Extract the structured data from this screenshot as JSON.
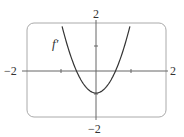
{
  "chart_data": {
    "type": "line",
    "title": "",
    "xlabel": "",
    "ylabel": "",
    "xlim": [
      -2,
      2
    ],
    "ylim": [
      -2,
      2
    ],
    "x_tick_labels": [
      "-2",
      "2"
    ],
    "y_tick_labels": [
      "2",
      "-2"
    ],
    "ticks": {
      "x": [
        -1,
        1
      ],
      "y": [
        1
      ]
    },
    "grid": false,
    "series": [
      {
        "name": "f′",
        "label": "f′",
        "description": "upward parabola, vertex near (0, -0.9), roots near x = ±0.56",
        "x": [
          -1.0,
          -0.8,
          -0.6,
          -0.4,
          -0.2,
          0.0,
          0.2,
          0.4,
          0.6,
          0.8,
          1.0
        ],
        "values": [
          2.0,
          0.96,
          0.14,
          -0.44,
          -0.78,
          -0.9,
          -0.78,
          -0.44,
          0.14,
          0.96,
          2.0
        ]
      }
    ]
  },
  "labels": {
    "x_min": "−2",
    "x_max": "2",
    "y_max": "2",
    "y_min": "−2",
    "curve": "f′"
  },
  "colors": {
    "curve": "#333333",
    "axis": "#555555",
    "frame": "#aaaaaa"
  }
}
